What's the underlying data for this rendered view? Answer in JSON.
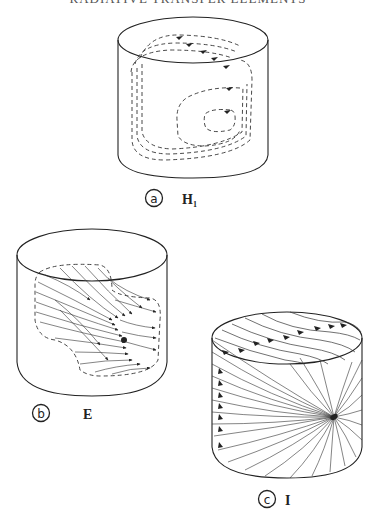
{
  "header": {
    "text": "RADIATIVE TRANSFER ELEMENTS",
    "note": "partially cut off at top edge"
  },
  "panels": [
    {
      "id": "a",
      "marker": "a",
      "label": "H₁",
      "quantity": "H1",
      "description": "Cylinder with dashed closed circulation loops on top face and side"
    },
    {
      "id": "b",
      "marker": "b",
      "label": "E",
      "quantity": "E",
      "description": "Cylinder with dashed region containing converging field lines with arrows"
    },
    {
      "id": "c",
      "marker": "c",
      "label": "I",
      "quantity": "I",
      "description": "Cylinder with field lines radiating from a focal point on the side"
    }
  ],
  "colors": {
    "line": "#222222",
    "background": "#ffffff"
  }
}
